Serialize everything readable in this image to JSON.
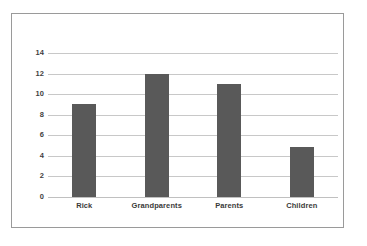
{
  "chart_data": {
    "type": "bar",
    "title": "",
    "subtitle": "",
    "xlabel": "",
    "ylabel": "",
    "categories": [
      "Rick",
      "Grandparents",
      "Parents",
      "Children"
    ],
    "values": [
      9,
      12,
      11,
      4.9
    ],
    "series": [
      {
        "name": "",
        "values": [
          9,
          12,
          11,
          4.9
        ]
      }
    ],
    "ylim": [
      0,
      14
    ],
    "ytick_labels": [
      "0",
      "2",
      "4",
      "6",
      "8",
      "10",
      "12",
      "14"
    ],
    "ytick_values": [
      0,
      2,
      4,
      6,
      8,
      10,
      12,
      14
    ],
    "grid": "horizontal",
    "legend": "none",
    "bar_color": "#595959",
    "gridline_color": "#c8c8c8",
    "border_color": "#9a9a9a",
    "text_color": "#3a3a3a",
    "background_color": "#ffffff"
  }
}
